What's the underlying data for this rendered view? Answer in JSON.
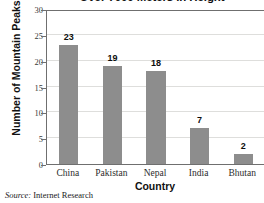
{
  "chart_data": {
    "type": "bar",
    "title": "Over 7000 Meters in Height",
    "xlabel": "Country",
    "ylabel": "Number of Mountain Peaks",
    "categories": [
      "China",
      "Pakistan",
      "Nepal",
      "India",
      "Bhutan"
    ],
    "values": [
      23,
      19,
      18,
      7,
      2
    ],
    "value_labels": [
      "23",
      "19",
      "18",
      "7",
      "2"
    ],
    "ylim": [
      0,
      30
    ],
    "yticks": [
      0,
      5,
      10,
      15,
      20,
      25,
      30
    ],
    "ytick_labels": [
      "0",
      "5",
      "10",
      "15",
      "20",
      "25",
      "30"
    ],
    "grid": true,
    "legend": false,
    "bar_color": "#8d8d8d",
    "grid_color": "#dededc",
    "axis_color": "#6f6f6f",
    "background": "#ffffff"
  },
  "source": {
    "label": "Source:",
    "text": "Internet Research"
  }
}
